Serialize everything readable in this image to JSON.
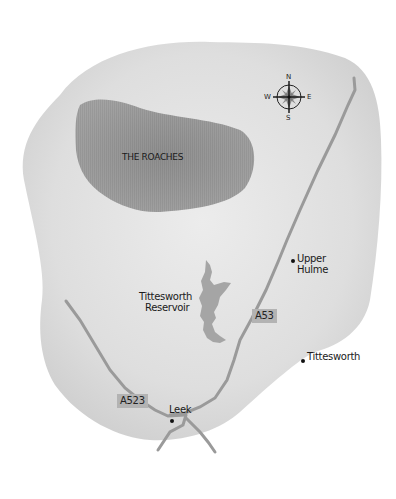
{
  "map": {
    "colors": {
      "land": "#dcdcdc",
      "land_edge": "#e9e9e9",
      "hills": "#9a9a9a",
      "water": "#a5a5a5",
      "road": "#9a9a9a",
      "road_tag": "#b3b3b3",
      "text": "#1a1a1a"
    },
    "areas": {
      "hills_label": "THE ROACHES",
      "reservoir_label_line1": "Tittesworth",
      "reservoir_label_line2": "Reservoir"
    },
    "roads": [
      {
        "id": "A53",
        "label": "A53"
      },
      {
        "id": "A523",
        "label": "A523"
      }
    ],
    "places": [
      {
        "name_line1": "Upper",
        "name_line2": "Hulme"
      },
      {
        "name": "Tittesworth"
      },
      {
        "name": "Leek"
      }
    ],
    "compass": {
      "north": "N",
      "east": "E",
      "south": "S",
      "west": "W"
    }
  }
}
